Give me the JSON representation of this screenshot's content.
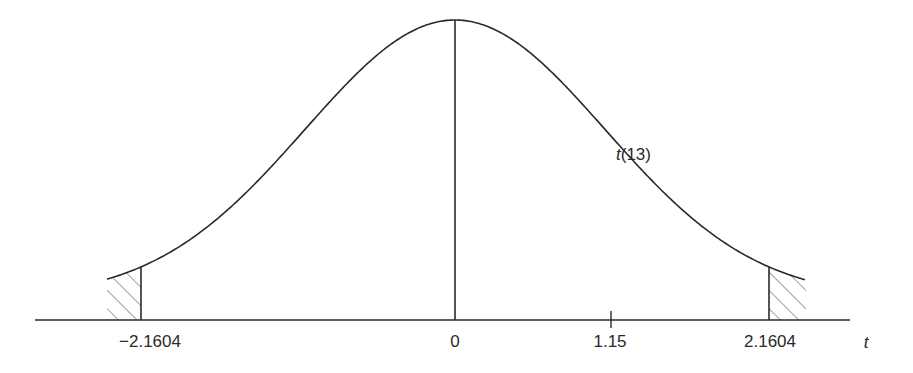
{
  "chart_data": {
    "type": "line",
    "title": "",
    "distribution": "t(13)",
    "curve_label": "t(13)",
    "xlabel": "t",
    "ylabel": "",
    "grid": false,
    "legend": "none",
    "x_ticks": [
      {
        "value": -2.1604,
        "label": "−2.1604"
      },
      {
        "value": 0,
        "label": "0"
      },
      {
        "value": 1.15,
        "label": "1.15"
      },
      {
        "value": 2.1604,
        "label": "2.1604"
      }
    ],
    "critical_values": [
      -2.1604,
      2.1604
    ],
    "observed_statistic": 1.15,
    "shaded_regions": [
      {
        "from": -2.45,
        "to": -2.1604,
        "style": "hatched",
        "side": "left tail"
      },
      {
        "from": 2.1604,
        "to": 2.45,
        "style": "hatched",
        "side": "right tail"
      }
    ],
    "x_range": [
      -2.45,
      2.45
    ],
    "center_line": 0
  },
  "labels": {
    "curve": "t(13)",
    "axis": "t",
    "tick_neg_crit": "−2.1604",
    "tick_zero": "0",
    "tick_obs": "1.15",
    "tick_pos_crit": "2.1604"
  },
  "colors": {
    "line": "#2a2a2a",
    "hatch": "#444444",
    "background": "#ffffff"
  }
}
